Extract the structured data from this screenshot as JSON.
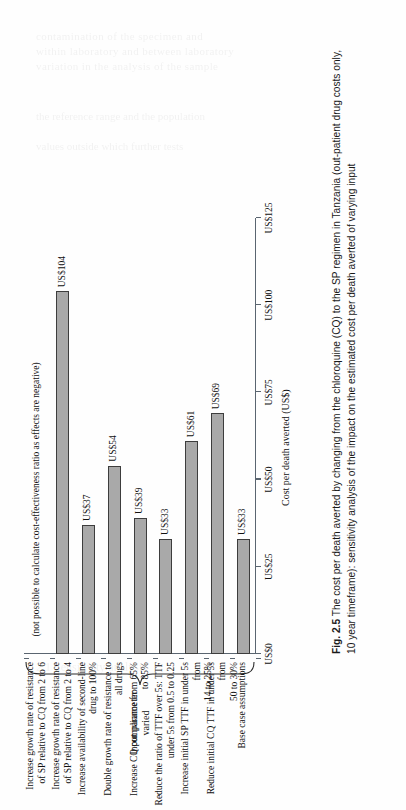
{
  "figure": {
    "number_label": "Fig. 2.5",
    "caption": "The cost per death averted by changing from the chloroquine (CQ) to the SP regimen in Tanzania (out-patient drug costs only, 10 year timeframe): sensitivity analysis of the impact on the estimated cost per death averted of varying input",
    "group_bracket_label": "Input parameter\nvaried",
    "negative_note": "(not possible to calculate cost-effectiveness ratio as effects are negative)"
  },
  "chart_data": {
    "type": "bar",
    "orientation": "horizontal",
    "title": "",
    "xlabel": "Cost per death averted (US$)",
    "ylabel": "Input parameter varied",
    "xlim": [
      0,
      125
    ],
    "grid": false,
    "legend": null,
    "tick_labels": [
      "US$0",
      "US$25",
      "US$50",
      "US$75",
      "US$100",
      "US$125"
    ],
    "tick_values": [
      0,
      25,
      50,
      75,
      100,
      125
    ],
    "categories": [
      "Base case assumptions",
      "Reduce initial CQ TTF in under 5s from\n50 to 30%",
      "Increase initial SP TTF in under 5s from\n14 to 25%",
      "Reduce the ratio of TTF over 5s: TTF\nunder 5s from 0.5 to 0.25",
      "Increase CQ compliance from 65%\nto 85%",
      "Double growth rate of resistance to\nall drugs",
      "Increase availability of second-line\ndrug to 100%",
      "Increase growth rate of resistance\nof SP relative to CQ from 2 to 4",
      "Increase growth rate of resistance\nof SP relative to CQ from 2 to 6"
    ],
    "values": [
      33,
      69,
      61,
      33,
      39,
      54,
      37,
      104,
      null
    ],
    "value_labels": [
      "US$33",
      "US$69",
      "US$61",
      "US$33",
      "US$39",
      "US$54",
      "US$37",
      "US$104",
      ""
    ],
    "colors": {
      "bar_fill": "#a9a9a9",
      "bar_stroke": "#3d3d3d",
      "axis": "#5a6570"
    }
  },
  "ghost_text": {
    "lines": [
      "contamination of the specimen and",
      "within laboratory and between laboratory",
      "variation in the analysis of the sample",
      "the reference range",
      "the population",
      "values outside"
    ]
  }
}
